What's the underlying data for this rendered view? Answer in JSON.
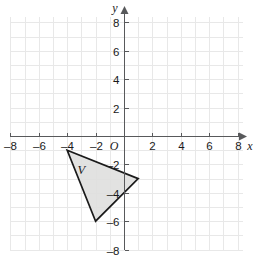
{
  "chart_data": {
    "type": "scatter",
    "title": "",
    "xlabel": "x",
    "ylabel": "y",
    "xlim": [
      -8,
      8
    ],
    "ylim": [
      -8,
      8
    ],
    "grid": true,
    "grid_step": 1,
    "tick_step": 2,
    "origin_label": "O",
    "x_ticks": [
      -8,
      -6,
      -4,
      -2,
      2,
      4,
      6,
      8
    ],
    "x_tick_labels": [
      "–8",
      "–6",
      "–4",
      "–2",
      "2",
      "4",
      "6",
      "8"
    ],
    "y_ticks": [
      8,
      6,
      4,
      2,
      -2,
      -4,
      -6,
      -8
    ],
    "y_tick_labels": [
      "8",
      "6",
      "4",
      "2",
      "–2",
      "–4",
      "–6",
      "–8"
    ],
    "shapes": [
      {
        "name": "triangle-v",
        "label": "V",
        "kind": "polygon",
        "vertices": [
          [
            -4,
            -1
          ],
          [
            1,
            -3
          ],
          [
            -2,
            -6
          ]
        ],
        "label_position": [
          -3,
          -2.4
        ],
        "fill": "#dededd",
        "stroke": "#1a1a1a"
      }
    ]
  },
  "axes": {
    "x_name": "x",
    "y_name": "y",
    "origin": "O"
  },
  "colors": {
    "grid": "#e8e8e8",
    "axis": "#58595b",
    "shape_fill": "#dededd",
    "shape_stroke": "#1a1a1a",
    "text": "#1a1a1a",
    "background": "#ffffff"
  }
}
